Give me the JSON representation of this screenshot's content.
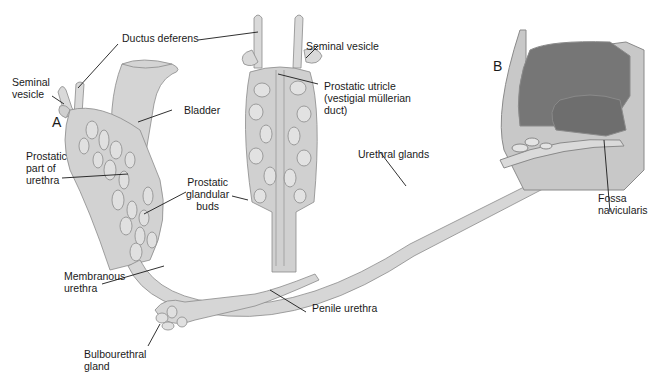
{
  "panels": {
    "a": "A",
    "b": "B"
  },
  "labels": {
    "ductus_deferens": "Ductus deferens",
    "seminal_vesicle_left": "Seminal\nvesicle",
    "seminal_vesicle_right": "Seminal vesicle",
    "bladder": "Bladder",
    "prostatic_utricle": "Prostatic utricle\n(vestigial müllerian\nduct)",
    "prostatic_part_urethra": "Prostatic\npart of\nurethra",
    "prostatic_glandular_buds": "Prostatic\nglandular\nbuds",
    "urethral_glands": "Urethral glands",
    "fossa_navicularis": "Fossa\nnavicularis",
    "membranous_urethra": "Membranous\nurethra",
    "penile_urethra": "Penile urethra",
    "bulbourethral_gland": "Bulbourethral\ngland"
  },
  "colors": {
    "tissue_light": "#d9d9d9",
    "tissue_mid": "#c4c4c4",
    "tissue_outline": "#8a8a8a",
    "glans_dark": "#767676",
    "leader_line": "#1a1a1a"
  }
}
